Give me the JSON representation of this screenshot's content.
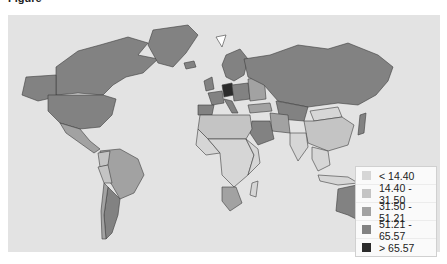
{
  "caption": {
    "prefix": "Figure",
    "text": "..."
  },
  "map": {
    "type": "choropleth",
    "projection": "mercator",
    "ocean_color": "#e3e3e3",
    "border_color": "#444444"
  },
  "legend": {
    "items": [
      {
        "label": "< 14.40",
        "color": "#d6d6d6"
      },
      {
        "label": "14.40 - 31.50",
        "color": "#c4c4c4"
      },
      {
        "label": "31.50 - 51.21",
        "color": "#a2a2a2"
      },
      {
        "label": "51.21 - 65.57",
        "color": "#828282"
      },
      {
        "label": "> 65.57",
        "color": "#2b2b2b"
      }
    ]
  }
}
